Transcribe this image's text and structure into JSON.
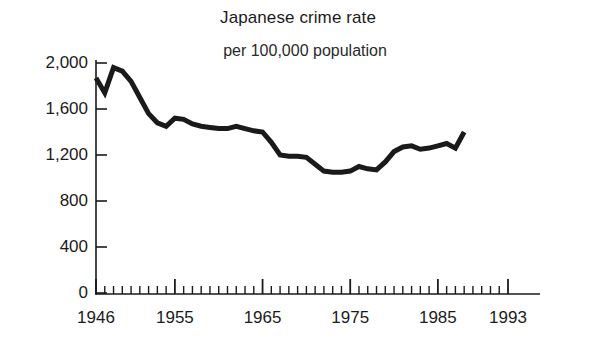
{
  "chart_data": {
    "type": "line",
    "title": "Japanese crime rate",
    "subtitle": "per 100,000 population",
    "xlabel": "",
    "ylabel": "",
    "xlim": [
      1946,
      1993
    ],
    "ylim": [
      0,
      2000
    ],
    "grid": false,
    "legend": null,
    "yticks": [
      0,
      400,
      800,
      1200,
      1600,
      2000
    ],
    "ytick_labels": [
      "0",
      "400",
      "800",
      "1,200",
      "1,600",
      "2,000"
    ],
    "xticks": [
      1946,
      1955,
      1965,
      1975,
      1985,
      1993
    ],
    "xtick_labels": [
      "1946",
      "1955",
      "1965",
      "1975",
      "1985",
      "1993"
    ],
    "minor_xtick_interval": 1,
    "line_color": "#1a1a1a",
    "line_width": 5,
    "x": [
      1946,
      1947,
      1948,
      1949,
      1950,
      1951,
      1952,
      1953,
      1954,
      1955,
      1956,
      1957,
      1958,
      1959,
      1960,
      1961,
      1962,
      1963,
      1964,
      1965,
      1966,
      1967,
      1968,
      1969,
      1970,
      1971,
      1972,
      1973,
      1974,
      1975,
      1976,
      1977,
      1978,
      1979,
      1980,
      1981,
      1982,
      1983,
      1984,
      1985,
      1986,
      1987,
      1988
    ],
    "series": [
      {
        "name": "Japanese crime rate per 100,000 population",
        "values": [
          1870,
          1740,
          1960,
          1930,
          1840,
          1700,
          1560,
          1480,
          1450,
          1520,
          1510,
          1470,
          1450,
          1440,
          1430,
          1430,
          1450,
          1430,
          1410,
          1400,
          1310,
          1200,
          1190,
          1190,
          1180,
          1120,
          1060,
          1050,
          1050,
          1060,
          1100,
          1080,
          1070,
          1140,
          1230,
          1270,
          1280,
          1250,
          1260,
          1280,
          1300,
          1260,
          1400
        ]
      }
    ]
  },
  "axis": {
    "y_axis_name": "value-axis",
    "x_axis_name": "year-axis"
  }
}
